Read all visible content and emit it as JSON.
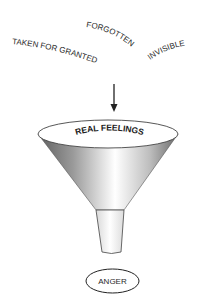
{
  "diagram": {
    "inputs": [
      {
        "label": "TAKEN FOR GRANTED"
      },
      {
        "label": "FORGOTTEN"
      },
      {
        "label": "INVISIBLE"
      }
    ],
    "funnel": {
      "label": "REAL FEELINGS"
    },
    "output": {
      "label": "ANGER"
    },
    "colors": {
      "stroke": "#333333",
      "funnel_dark": "#6e6e6e",
      "funnel_light": "#ffffff"
    }
  }
}
